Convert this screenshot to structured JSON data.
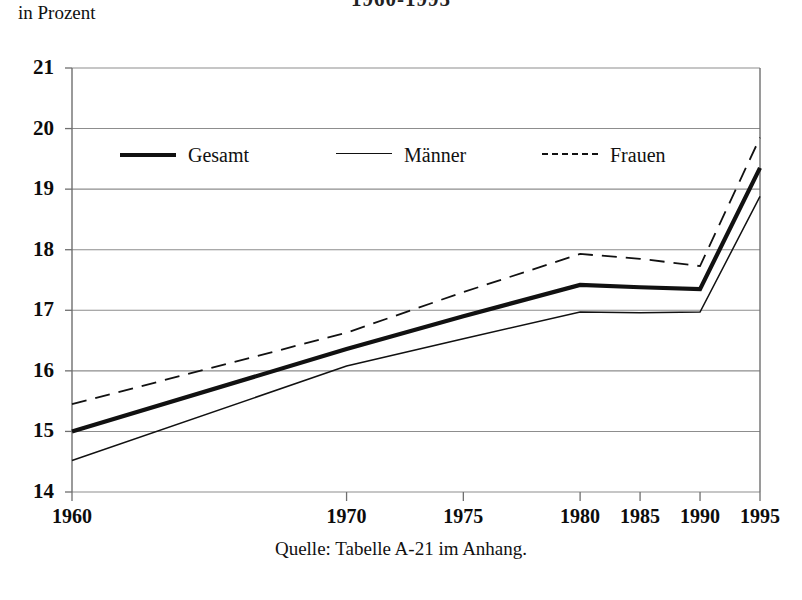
{
  "subtitle": "in Prozent",
  "title": "1960-1995",
  "source_note": "Quelle: Tabelle A-21 im Anhang.",
  "colors": {
    "ink": "#111111",
    "gridline": "#8d8d8d",
    "axis": "#6f6f6f",
    "background": "#ffffff"
  },
  "legend": [
    {
      "label": "Gesamt",
      "style": "thick-solid",
      "x": 0
    },
    {
      "label": "Männer",
      "style": "thin-solid",
      "x": 216
    },
    {
      "label": "Frauen",
      "style": "dashed",
      "x": 422
    }
  ],
  "axes": {
    "y_ticks": [
      "21",
      "20",
      "19",
      "18",
      "17",
      "16",
      "15",
      "14"
    ],
    "x_ticks": [
      "1960",
      "1970",
      "1975",
      "1980",
      "1985",
      "1990",
      "1995"
    ]
  },
  "chart_data": {
    "type": "line",
    "title": "1960-1995",
    "subtitle": "in Prozent",
    "xlabel": "",
    "ylabel": "in Prozent",
    "ylim": [
      14,
      21
    ],
    "ytick_step": 1,
    "grid": true,
    "legend_position": "inside-top-left",
    "categories": [
      "1960",
      "1970",
      "1975",
      "1980",
      "1985",
      "1990",
      "1995"
    ],
    "category_positions": [
      0,
      0.435,
      0.62,
      0.805,
      0.9,
      0.995,
      1.09
    ],
    "series": [
      {
        "name": "Gesamt",
        "style": "thick-solid",
        "values": [
          15.0,
          16.36,
          16.9,
          17.42,
          17.38,
          17.35,
          19.35
        ]
      },
      {
        "name": "Männer",
        "style": "thin-solid",
        "values": [
          14.52,
          16.08,
          16.53,
          16.97,
          16.96,
          16.97,
          18.88
        ]
      },
      {
        "name": "Frauen",
        "style": "dashed",
        "values": [
          15.45,
          16.63,
          17.3,
          17.93,
          17.85,
          17.73,
          19.85
        ]
      }
    ],
    "source": "Quelle: Tabelle A-21 im Anhang."
  }
}
